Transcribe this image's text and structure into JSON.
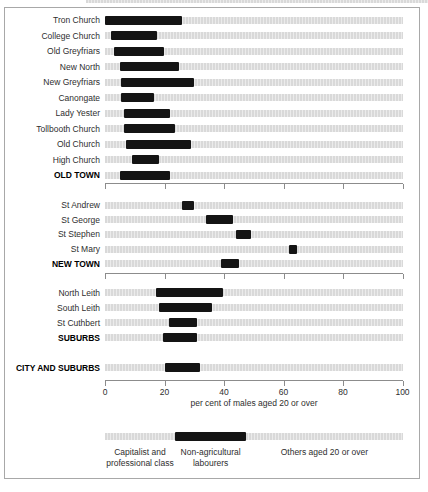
{
  "chart_data": {
    "type": "bar",
    "orientation": "horizontal-range",
    "xlabel": "per cent of males aged 20 or over",
    "xlim": [
      0,
      100
    ],
    "x_ticks": [
      0,
      20,
      40,
      60,
      80,
      100
    ],
    "grid": false,
    "colors": {
      "bar_black": "#141414",
      "track_gray": "#d9d9d9",
      "track_stripe": "#ebebeb",
      "axis_gray": "#8c8c8c"
    },
    "sections": [
      {
        "name": "old-town",
        "rows": [
          {
            "label": "Tron Church",
            "start": 0,
            "end": 26,
            "bold": false
          },
          {
            "label": "College Church",
            "start": 2,
            "end": 17.5,
            "bold": false
          },
          {
            "label": "Old Greyfriars",
            "start": 3,
            "end": 20,
            "bold": false
          },
          {
            "label": "New North",
            "start": 5,
            "end": 25,
            "bold": false
          },
          {
            "label": "New Greyfriars",
            "start": 5.5,
            "end": 30,
            "bold": false
          },
          {
            "label": "Canongate",
            "start": 5.5,
            "end": 16.5,
            "bold": false
          },
          {
            "label": "Lady Yester",
            "start": 6.5,
            "end": 22,
            "bold": false
          },
          {
            "label": "Tollbooth Church",
            "start": 6.5,
            "end": 23.5,
            "bold": false
          },
          {
            "label": "Old Church",
            "start": 7,
            "end": 29,
            "bold": false
          },
          {
            "label": "High Church",
            "start": 9,
            "end": 18,
            "bold": false
          },
          {
            "label": "OLD TOWN",
            "start": 5,
            "end": 22,
            "bold": true
          }
        ]
      },
      {
        "name": "new-town",
        "rows": [
          {
            "label": "St Andrew",
            "start": 26,
            "end": 30,
            "bold": false
          },
          {
            "label": "St George",
            "start": 34,
            "end": 43,
            "bold": false
          },
          {
            "label": "St Stephen",
            "start": 44,
            "end": 49,
            "bold": false
          },
          {
            "label": "St Mary",
            "start": 62,
            "end": 64.5,
            "bold": false
          },
          {
            "label": "NEW TOWN",
            "start": 39,
            "end": 45,
            "bold": true
          }
        ]
      },
      {
        "name": "suburbs",
        "rows": [
          {
            "label": "North Leith",
            "start": 17,
            "end": 39.5,
            "bold": false
          },
          {
            "label": "South Leith",
            "start": 18,
            "end": 36,
            "bold": false
          },
          {
            "label": "St Cuthbert",
            "start": 21.5,
            "end": 31,
            "bold": false
          },
          {
            "label": "SUBURBS",
            "start": 19.5,
            "end": 31,
            "bold": true
          }
        ]
      },
      {
        "name": "city-and-suburbs",
        "rows": [
          {
            "label": "CITY AND SUBURBS",
            "start": 20,
            "end": 32,
            "bold": true
          }
        ]
      }
    ],
    "legend": {
      "black_segment": {
        "from": 23.5,
        "to": 47.5
      },
      "items": [
        {
          "lines": [
            "Capitalist and",
            "professional class"
          ],
          "center_value": 11.75
        },
        {
          "lines": [
            "Non-agricultural",
            "labourers"
          ],
          "center_value": 35.5
        },
        {
          "lines": [
            "Others aged 20 or over"
          ],
          "center_value": 73.75
        }
      ]
    }
  }
}
